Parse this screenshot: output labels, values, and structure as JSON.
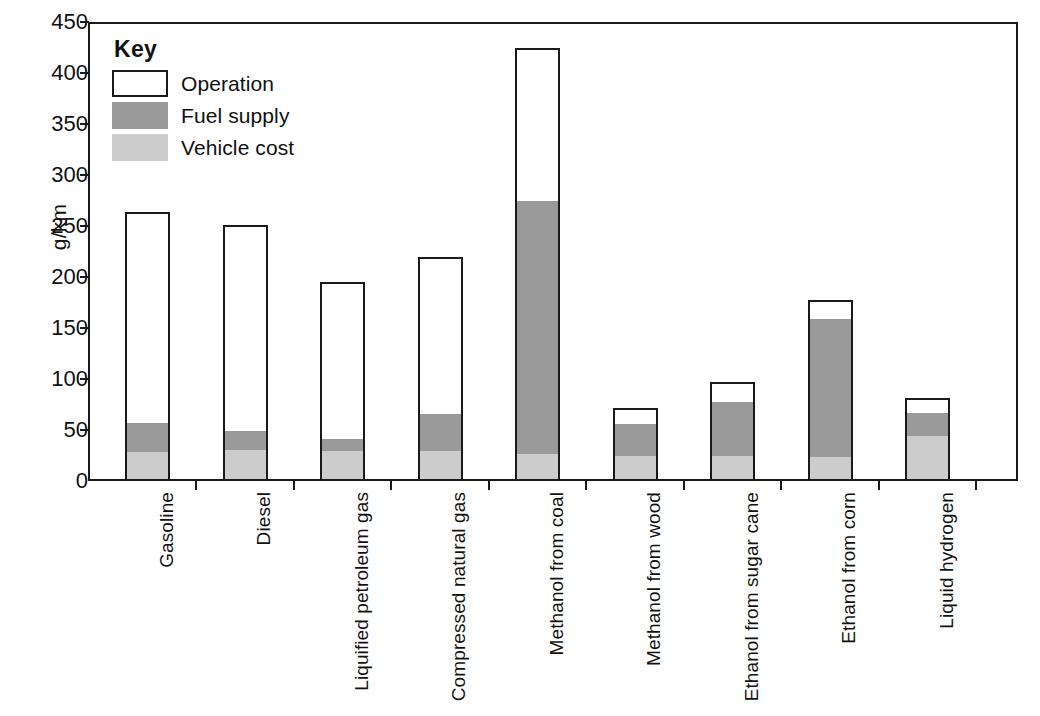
{
  "chart_data": {
    "type": "bar",
    "subtype": "stacked-bar",
    "title": "",
    "xlabel": "",
    "ylabel": "g/km",
    "ylim": [
      0,
      450
    ],
    "ytick_values": [
      0,
      50,
      100,
      150,
      200,
      250,
      300,
      350,
      400,
      450
    ],
    "ytick_labels": [
      "0",
      "50",
      "100",
      "150",
      "200",
      "250",
      "300",
      "350",
      "400",
      "450"
    ],
    "grid": false,
    "legend_position": "inside-top-left",
    "legend_title": "Key",
    "categories": [
      "Gasoline",
      "Diesel",
      "Liquified petroleum gas",
      "Compressed natural gas",
      "Methanol from coal",
      "Methanol from wood",
      "Ethanol from sugar cane",
      "Ethanol from corn",
      "Liquid hydrogen"
    ],
    "series": [
      {
        "name": "Vehicle cost",
        "color": "#cccccc",
        "values": [
          27,
          29,
          28,
          28,
          25,
          24,
          24,
          22,
          44
        ]
      },
      {
        "name": "Fuel supply",
        "color": "#9a9a9a",
        "values": [
          29,
          19,
          12,
          37,
          250,
          33,
          55,
          138,
          24
        ]
      },
      {
        "name": "Operation",
        "color": "#ffffff",
        "values": [
          208,
          203,
          155,
          155,
          150,
          15,
          18,
          17,
          13
        ]
      }
    ],
    "totals": [
      264,
      251,
      195,
      220,
      425,
      72,
      97,
      177,
      81
    ]
  },
  "legend": {
    "title": "Key",
    "entries": [
      {
        "label": "Operation",
        "swatch": "operation"
      },
      {
        "label": "Fuel supply",
        "swatch": "fuel"
      },
      {
        "label": "Vehicle cost",
        "swatch": "vehicle"
      }
    ]
  },
  "axis": {
    "y_title": "g/km"
  },
  "colors": {
    "operation": "#ffffff",
    "fuel_supply": "#9a9a9a",
    "vehicle_cost": "#cccccc",
    "axis": "#1a1a1a",
    "background": "#ffffff"
  }
}
